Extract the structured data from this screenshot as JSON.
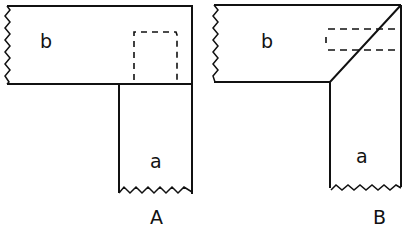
{
  "figures": [
    {
      "caption": "A",
      "upper_piece_label": "b",
      "lower_piece_label": "a",
      "joint": "butt joint with dashed tenon outline"
    },
    {
      "caption": "B",
      "upper_piece_label": "b",
      "lower_piece_label": "a",
      "joint": "mitre joint with dashed spline outline"
    }
  ],
  "colors": {
    "line": "#111111",
    "background": "#ffffff"
  }
}
